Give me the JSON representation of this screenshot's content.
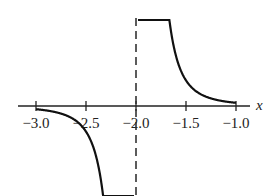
{
  "chart_data": {
    "type": "line",
    "title": "",
    "xlabel": "x",
    "ylabel": "",
    "xlim": [
      -3.0,
      -1.0
    ],
    "x_ticks": [
      -3.0,
      -2.5,
      -2.0,
      -1.5,
      -1.0
    ],
    "x_tick_labels": [
      "−3.0",
      "−2.5",
      "−2.0",
      "−1.5",
      "−1.0"
    ],
    "grid": false,
    "legend": null,
    "vertical_asymptote": {
      "x": -2.0,
      "style": "dashed"
    },
    "series": [
      {
        "name": "f(x) = 1/(x+2)^3",
        "description": "Odd rational function with vertical asymptote at x = -2; approaches 0 as x moves away from -2, goes to +infinity as x -> -2 from the right and -infinity as x -> -2 from the left",
        "branches": [
          {
            "x": [
              -3.0,
              -2.8,
              -2.6,
              -2.4,
              -2.3,
              -2.2,
              -2.15,
              -2.1
            ],
            "y": [
              -1,
              -1.95,
              -4.63,
              -15.6,
              -37,
              -125,
              -296,
              -1000
            ]
          },
          {
            "x": [
              -1.9,
              -1.85,
              -1.8,
              -1.7,
              -1.6,
              -1.4,
              -1.2,
              -1.0
            ],
            "y": [
              1000,
              296,
              125,
              37,
              15.6,
              4.63,
              1.95,
              1
            ]
          }
        ]
      }
    ]
  },
  "axis": {
    "variable_label": "x"
  }
}
